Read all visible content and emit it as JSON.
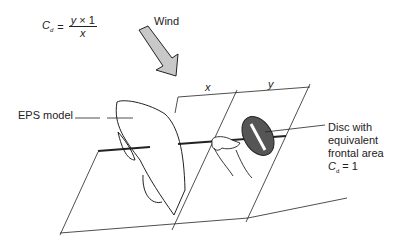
{
  "formula": {
    "lhs_symbol": "C",
    "lhs_subscript": "d",
    "equals": "=",
    "numerator_var": "y",
    "numerator_op": " × ",
    "numerator_const": "1",
    "denominator": "x"
  },
  "labels": {
    "wind": "Wind",
    "eps_model": "EPS model",
    "dim_x": "x",
    "dim_y": "y",
    "disc_line1": "Disc with",
    "disc_line2": "equivalent",
    "disc_line3": "frontal area",
    "disc_cd_symbol": "C",
    "disc_cd_subscript": "d",
    "disc_cd_value": " = 1"
  },
  "colors": {
    "line": "#222222",
    "arrow_fill": "#c8c8c8",
    "disc_fill": "#555555",
    "background": "#ffffff"
  }
}
